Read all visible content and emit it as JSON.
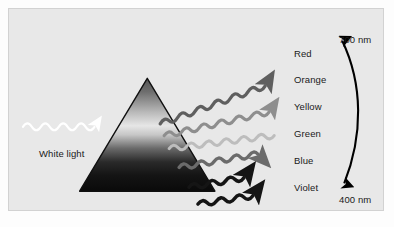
{
  "figure": {
    "background_color": "#e8e8e8",
    "border_color": "#d2d2d2"
  },
  "input_beam": {
    "label": "White light",
    "wave_color": "#ffffff",
    "icon": "wavy-arrow-icon"
  },
  "prism": {
    "name": "triangular-prism",
    "outline_color": "#111111",
    "gradient_top_color": "#4a4a4a",
    "gradient_highlight_color": "#e0e0e0",
    "gradient_bottom_color": "#0a0a0a"
  },
  "spectrum": {
    "bands": [
      {
        "label": "Red",
        "wave_color": "#5f5f5f",
        "has_arrowhead": true,
        "y": 45
      },
      {
        "label": "Orange",
        "wave_color": "#8e8e8e",
        "has_arrowhead": true,
        "y": 71
      },
      {
        "label": "Yellow",
        "wave_color": "#bdbdbd",
        "has_arrowhead": false,
        "y": 98
      },
      {
        "label": "Green",
        "wave_color": "#6b6b6b",
        "has_arrowhead": true,
        "y": 125
      },
      {
        "label": "Blue",
        "wave_color": "#151515",
        "has_arrowhead": true,
        "y": 152
      },
      {
        "label": "Violet",
        "wave_color": "#151515",
        "has_arrowhead": true,
        "y": 179
      }
    ]
  },
  "wavelength_scale": {
    "name": "wavelength-range-arrow",
    "top_label": "700 nm",
    "bottom_label": "400 nm",
    "arrow_color": "#000000",
    "double_headed": true
  }
}
